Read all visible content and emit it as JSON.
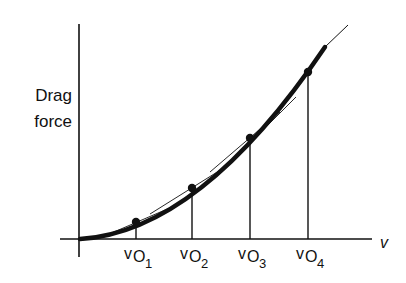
{
  "diagram": {
    "title": "",
    "y_axis_label_line1": "Drag",
    "y_axis_label_line2": "force",
    "x_axis_label": "v",
    "curve": "Drag force vs velocity (parabolic), approximated by tangent segments at operating points",
    "operating_points": [
      {
        "label": "v",
        "subscript": "O",
        "index": "1"
      },
      {
        "label": "v",
        "subscript": "O",
        "index": "2"
      },
      {
        "label": "v",
        "subscript": "O",
        "index": "3"
      },
      {
        "label": "v",
        "subscript": "O",
        "index": "4"
      }
    ],
    "colors": {
      "ink": "#111111",
      "background": "#ffffff"
    }
  }
}
